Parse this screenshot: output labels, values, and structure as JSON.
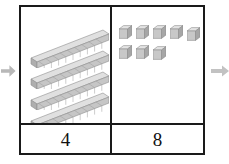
{
  "diagram": {
    "type": "base-ten-blocks-place-value-chart",
    "represented_number": 48,
    "background_color": "#ffffff",
    "border_color": "#1a1a1a",
    "block_color": "#c9c9c9",
    "block_top_color": "#e2e2e2",
    "block_shadow_color": "#9a9a9a",
    "arrow_color": "#b4b4b4"
  },
  "columns": [
    {
      "key": "tens",
      "label": "4",
      "block_type": "rod",
      "block_count": 4,
      "units_per_block": 10,
      "total_units": 40
    },
    {
      "key": "ones",
      "label": "8",
      "block_type": "cube",
      "block_count": 8,
      "units_per_block": 1,
      "total_units": 8,
      "rows": [
        5,
        3
      ]
    }
  ],
  "arrows": [
    {
      "key": "left",
      "direction": "right",
      "name": "flow-arrow-in"
    },
    {
      "key": "right",
      "direction": "right",
      "name": "flow-arrow-out"
    }
  ]
}
